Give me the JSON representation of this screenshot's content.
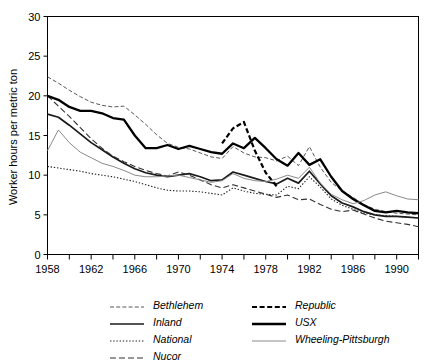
{
  "chart_data": {
    "type": "line",
    "title": "",
    "xlabel": "",
    "ylabel": "Worker hours per metric ton",
    "xlim": [
      1958,
      1992
    ],
    "ylim": [
      0,
      30
    ],
    "yticks": [
      0,
      5,
      10,
      15,
      20,
      25,
      30
    ],
    "xticks": [
      1958,
      1960,
      1962,
      1964,
      1966,
      1968,
      1970,
      1972,
      1974,
      1976,
      1978,
      1980,
      1982,
      1984,
      1986,
      1988,
      1990,
      1992
    ],
    "xtick_labels": [
      "1958",
      "",
      "1962",
      "",
      "1966",
      "",
      "1970",
      "",
      "1974",
      "",
      "1978",
      "",
      "1982",
      "",
      "1986",
      "",
      "1990",
      ""
    ],
    "grid": false,
    "legend_position": "below",
    "series": [
      {
        "name": "Bethlehem",
        "style": "thin-dashed",
        "color": "#444444",
        "x": [
          1958,
          1959,
          1960,
          1961,
          1962,
          1963,
          1964,
          1965,
          1966,
          1967,
          1968,
          1969,
          1970,
          1971,
          1972,
          1973,
          1974,
          1975,
          1976,
          1977,
          1978,
          1979,
          1980,
          1981,
          1982,
          1983,
          1984,
          1985,
          1986,
          1987,
          1988,
          1989,
          1990,
          1991,
          1992
        ],
        "y": [
          22.4,
          21.6,
          20.7,
          19.9,
          19.2,
          18.8,
          18.6,
          18.7,
          17.6,
          16.4,
          15.1,
          14.0,
          13.5,
          13.3,
          12.8,
          12.3,
          12.1,
          13.6,
          12.8,
          12.3,
          12.2,
          11.8,
          12.4,
          11.2,
          13.6,
          11.0,
          9.1,
          8.0,
          7.2,
          6.3,
          5.7,
          5.4,
          5.2,
          5.1,
          5.0
        ]
      },
      {
        "name": "Inland",
        "style": "thick-solid",
        "color": "#1a1a1a",
        "x": [
          1958,
          1959,
          1960,
          1961,
          1962,
          1963,
          1964,
          1965,
          1966,
          1967,
          1968,
          1969,
          1970,
          1971,
          1972,
          1973,
          1974,
          1975,
          1976,
          1977,
          1978,
          1979,
          1980,
          1981,
          1982,
          1983,
          1984,
          1985,
          1986,
          1987,
          1988,
          1989,
          1990,
          1991,
          1992
        ],
        "y": [
          17.7,
          17.3,
          16.3,
          15.2,
          14.1,
          13.2,
          12.3,
          11.5,
          10.8,
          10.3,
          10.0,
          9.8,
          10.0,
          10.2,
          9.8,
          9.3,
          9.4,
          10.4,
          10.0,
          9.6,
          9.2,
          8.9,
          9.6,
          9.0,
          10.5,
          8.9,
          7.4,
          6.5,
          6.0,
          5.4,
          5.0,
          4.8,
          4.8,
          4.7,
          4.6
        ]
      },
      {
        "name": "National",
        "style": "dotted",
        "color": "#222222",
        "x": [
          1958,
          1959,
          1960,
          1961,
          1962,
          1963,
          1964,
          1965,
          1966,
          1967,
          1968,
          1969,
          1970,
          1971,
          1972,
          1973,
          1974,
          1975,
          1976,
          1977,
          1978,
          1979,
          1980,
          1981,
          1982,
          1983,
          1984,
          1985,
          1986,
          1987,
          1988,
          1989,
          1990,
          1991,
          1992
        ],
        "y": [
          11.1,
          10.9,
          10.7,
          10.5,
          10.2,
          10.0,
          9.8,
          9.5,
          9.2,
          8.8,
          8.4,
          8.1,
          8.0,
          8.0,
          7.9,
          7.7,
          7.5,
          8.4,
          8.0,
          7.7,
          7.6,
          7.5,
          8.6,
          8.3,
          9.8,
          8.5,
          7.0,
          6.2,
          5.7,
          5.2,
          5.0,
          4.9,
          4.8,
          4.7,
          4.6
        ]
      },
      {
        "name": "Nucor",
        "style": "dashed",
        "color": "#333333",
        "x": [
          1958,
          1959,
          1960,
          1961,
          1962,
          1963,
          1964,
          1965,
          1966,
          1967,
          1968,
          1969,
          1970,
          1971,
          1972,
          1973,
          1974,
          1975,
          1976,
          1977,
          1978,
          1979,
          1980,
          1981,
          1982,
          1983,
          1984,
          1985,
          1986,
          1987,
          1988,
          1989,
          1990,
          1991,
          1992
        ],
        "y": [
          20.0,
          18.7,
          17.4,
          16.0,
          14.6,
          13.4,
          12.4,
          11.7,
          11.1,
          10.6,
          10.2,
          9.9,
          10.4,
          10.0,
          9.4,
          8.8,
          8.4,
          8.8,
          8.4,
          8.0,
          7.6,
          7.2,
          7.5,
          6.9,
          7.0,
          6.3,
          5.7,
          5.4,
          5.6,
          5.1,
          4.6,
          4.2,
          4.0,
          3.8,
          3.5
        ]
      },
      {
        "name": "Republic",
        "style": "thick-dashed",
        "color": "#000000",
        "x": [
          1974,
          1975,
          1976,
          1977,
          1978,
          1979
        ],
        "y": [
          14.0,
          15.9,
          16.7,
          13.1,
          10.3,
          8.6
        ]
      },
      {
        "name": "USX",
        "style": "extra-thick-solid",
        "color": "#000000",
        "x": [
          1958,
          1959,
          1960,
          1961,
          1962,
          1963,
          1964,
          1965,
          1966,
          1967,
          1968,
          1969,
          1970,
          1971,
          1972,
          1973,
          1974,
          1975,
          1976,
          1977,
          1978,
          1979,
          1980,
          1981,
          1982,
          1983,
          1984,
          1985,
          1986,
          1987,
          1988,
          1989,
          1990,
          1991,
          1992
        ],
        "y": [
          20.0,
          19.5,
          18.6,
          18.1,
          18.1,
          17.8,
          17.2,
          17.0,
          15.0,
          13.4,
          13.4,
          13.8,
          13.3,
          13.7,
          13.3,
          12.9,
          12.7,
          14.0,
          13.4,
          14.7,
          13.4,
          12.0,
          11.2,
          12.8,
          11.3,
          12.0,
          9.8,
          8.0,
          7.0,
          6.2,
          5.5,
          5.3,
          5.5,
          5.3,
          5.2
        ]
      },
      {
        "name": "Wheeling-Pittsburgh",
        "style": "thin-gray-solid",
        "color": "#8a8a8a",
        "x": [
          1958,
          1959,
          1960,
          1961,
          1962,
          1963,
          1964,
          1965,
          1966,
          1967,
          1968,
          1969,
          1970,
          1971,
          1972,
          1973,
          1974,
          1975,
          1976,
          1977,
          1978,
          1979,
          1980,
          1981,
          1982,
          1983,
          1984,
          1985,
          1986,
          1987,
          1988,
          1989,
          1990,
          1991,
          1992
        ],
        "y": [
          13.1,
          15.7,
          14.1,
          12.9,
          12.2,
          11.5,
          11.1,
          10.6,
          10.0,
          9.8,
          9.8,
          9.9,
          10.0,
          9.7,
          9.4,
          9.1,
          9.3,
          10.2,
          9.6,
          9.3,
          9.2,
          9.5,
          10.0,
          9.6,
          11.0,
          9.0,
          7.6,
          6.9,
          6.4,
          6.8,
          7.5,
          7.9,
          7.4,
          7.0,
          6.9
        ]
      }
    ]
  },
  "legend": {
    "columns": [
      {
        "items": [
          {
            "label": "Bethlehem",
            "style": "thin-dashed"
          },
          {
            "label": "Inland",
            "style": "thick-solid"
          },
          {
            "label": "National",
            "style": "dotted"
          },
          {
            "label": "Nucor",
            "style": "dashed"
          }
        ]
      },
      {
        "items": [
          {
            "label": "Republic",
            "style": "thick-dashed"
          },
          {
            "label": "USX",
            "style": "extra-thick-solid"
          },
          {
            "label": "Wheeling-Pittsburgh",
            "style": "thin-gray-solid"
          }
        ]
      }
    ]
  }
}
